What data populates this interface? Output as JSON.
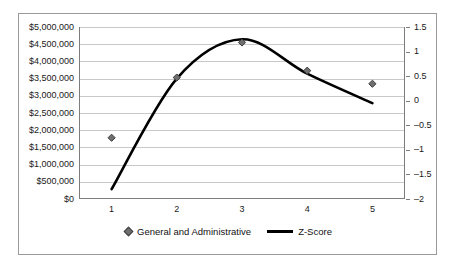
{
  "chart_data": {
    "type": "line",
    "title": "",
    "xlabel": "",
    "categories": [
      "1",
      "2",
      "3",
      "4",
      "5"
    ],
    "x": [
      1,
      2,
      3,
      4,
      5
    ],
    "grid": true,
    "legend_position": "bottom",
    "axes": {
      "left": {
        "label": "",
        "ylim": [
          0,
          5000000
        ],
        "ticks": [
          "$5,000,000",
          "$4,500,000",
          "$4,000,000",
          "$3,500,000",
          "$3,000,000",
          "$2,500,000",
          "$2,000,000",
          "$1,500,000",
          "$1,000,000",
          "$500,000",
          "$0"
        ],
        "tick_values": [
          5000000,
          4500000,
          4000000,
          3500000,
          3000000,
          2500000,
          2000000,
          1500000,
          1000000,
          500000,
          0
        ]
      },
      "right": {
        "label": "",
        "ylim": [
          -2,
          1.5
        ],
        "ticks": [
          "1.5",
          "1",
          "0.5",
          "0",
          "-0.5",
          "-1",
          "-1.5",
          "-2"
        ],
        "tick_values": [
          1.5,
          1,
          0.5,
          0,
          -0.5,
          -1,
          -1.5,
          -2
        ]
      }
    },
    "series": [
      {
        "name": "General and Administrative",
        "type": "scatter",
        "axis": "left",
        "marker": "diamond",
        "color": "#6f6f6f",
        "values": [
          1780000,
          3530000,
          4550000,
          3730000,
          3350000
        ]
      },
      {
        "name": "Z-Score",
        "type": "line",
        "axis": "right",
        "color": "#000000",
        "values": [
          -1.8,
          0.45,
          1.25,
          0.55,
          -0.05
        ]
      }
    ]
  },
  "legend": {
    "entries": [
      {
        "label": "General and Administrative",
        "marker": "diamond-marker"
      },
      {
        "label": "Z-Score",
        "marker": "line-marker"
      }
    ]
  },
  "colors": {
    "marker": "#6f6f6f",
    "line": "#000000",
    "gridline": "#c9c9c9",
    "axis": "#7d7d7d",
    "frame": "#9a9a9a",
    "background": "#ffffff"
  }
}
